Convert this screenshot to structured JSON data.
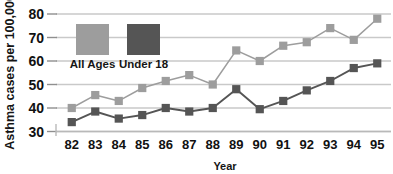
{
  "chart_data": {
    "type": "line",
    "title": "",
    "xlabel": "Year",
    "ylabel": "Asthma cases per 100,000",
    "categories": [
      "82",
      "83",
      "84",
      "85",
      "86",
      "87",
      "88",
      "89",
      "90",
      "91",
      "92",
      "93",
      "94",
      "95"
    ],
    "yticks": [
      30,
      40,
      50,
      60,
      70,
      80
    ],
    "ylim": [
      30,
      80
    ],
    "grid": true,
    "legend_position": "top-left-inside",
    "markers": "square",
    "series": [
      {
        "name": "All Ages",
        "color": "#9d9d9d",
        "values": [
          40,
          45.5,
          43,
          48.5,
          51.5,
          54,
          50,
          64.5,
          60,
          66.5,
          68,
          74,
          69,
          78
        ]
      },
      {
        "name": "Under 18",
        "color": "#555555",
        "values": [
          34,
          38.5,
          35.5,
          37,
          40,
          38.5,
          40,
          48,
          39.5,
          43,
          47.5,
          51.5,
          57,
          59
        ]
      }
    ]
  },
  "legend": {
    "items": [
      {
        "label": "All Ages",
        "color": "#9d9d9d"
      },
      {
        "label": "Under 18",
        "color": "#555555"
      }
    ]
  },
  "axes": {
    "y_title": "Asthma cases per 100,000",
    "x_title": "Year"
  }
}
